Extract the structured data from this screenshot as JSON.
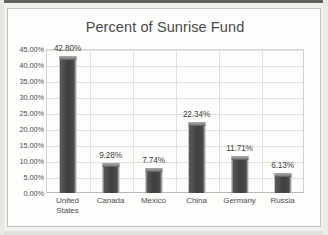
{
  "chart_data": {
    "type": "bar",
    "title": "Percent of Sunrise Fund",
    "xlabel": "",
    "ylabel": "",
    "categories": [
      "United States",
      "Canada",
      "Mexico",
      "China",
      "Germany",
      "Russia"
    ],
    "values": [
      42.8,
      9.28,
      7.74,
      22.34,
      11.71,
      6.13
    ],
    "data_labels": [
      "42.80%",
      "9.28%",
      "7.74%",
      "22.34%",
      "11.71%",
      "6.13%"
    ],
    "ylim": [
      0,
      45
    ],
    "ytick_values": [
      0,
      5,
      10,
      15,
      20,
      25,
      30,
      35,
      40,
      45
    ],
    "ytick_labels": [
      "0.00%",
      "5.00%",
      "10.00%",
      "15.00%",
      "20.00%",
      "25.00%",
      "30.00%",
      "35.00%",
      "40.00%",
      "45.00%"
    ],
    "grid": true,
    "legend": false,
    "legend_position": "none",
    "bar_color": "#4a4a48",
    "text_color": "#4e4e4c",
    "gridline_color": "#e1e0de",
    "plot_background": "#fdfdfc"
  }
}
